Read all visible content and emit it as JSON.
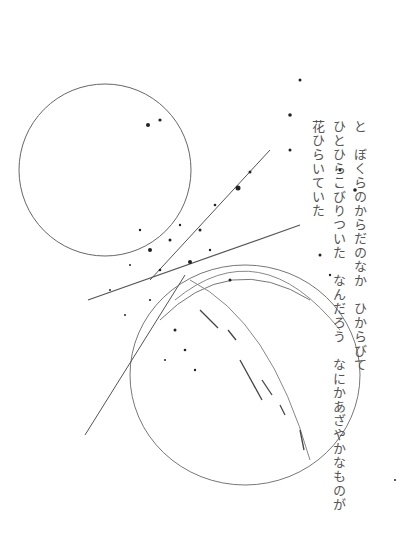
{
  "poem": {
    "lines": [
      "と　ぼくらのからだのなか　ひからびて",
      "ひとひらこびりついた　なんだろう　なにかあざやかなものが",
      "花ひらいていた"
    ]
  },
  "colors": {
    "ink": "#555555",
    "line": "#666666",
    "speck": "#222222"
  }
}
